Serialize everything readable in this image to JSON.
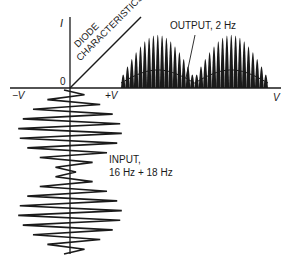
{
  "figure": {
    "axes": {
      "y_label": "I",
      "origin_label": "0",
      "x_neg_label": "−V",
      "x_pos_label": "+V",
      "x_end_label": "V"
    },
    "curve": {
      "label_line1": "DIODE",
      "label_line2": "CHARACTERISTICS"
    },
    "output": {
      "label": "OUTPUT, 2 Hz",
      "description": "half-wave rectified beat pulses with 2 Hz envelope, two lobes"
    },
    "input": {
      "label_line1": "INPUT,",
      "label_line2": "16 Hz + 18 Hz",
      "description": "sum of two sinusoids plotted downward in time, two beat lobes"
    },
    "colors": {
      "ink": "#1a1a1a",
      "background": "#ffffff"
    }
  }
}
